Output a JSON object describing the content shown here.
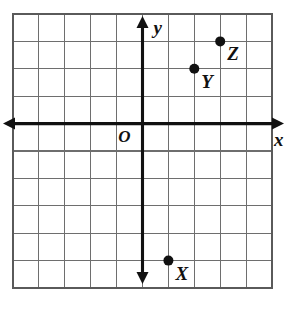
{
  "figure": {
    "name": "coordinate-plane-with-points",
    "background_color": "#ffffff"
  },
  "chart_data": {
    "type": "scatter",
    "title": "",
    "xlabel": "x",
    "ylabel": "y",
    "origin_label": "O",
    "grid": true,
    "grid_columns": 10,
    "grid_rows": 10,
    "xlim": [
      -5,
      5
    ],
    "ylim": [
      -6,
      4
    ],
    "x_ticks": [
      -5,
      -4,
      -3,
      -2,
      -1,
      0,
      1,
      2,
      3,
      4,
      5
    ],
    "y_ticks": [
      -6,
      -5,
      -4,
      -3,
      -2,
      -1,
      0,
      1,
      2,
      3,
      4
    ],
    "tick_labels_shown": false,
    "legend": "none",
    "points": [
      {
        "label": "X",
        "x": 1,
        "y": -5
      },
      {
        "label": "Y",
        "x": 2,
        "y": 2
      },
      {
        "label": "Z",
        "x": 3,
        "y": 3
      }
    ],
    "colors": {
      "point": "#111111",
      "axis": "#111111",
      "grid": "#6e6e6e",
      "border": "#5a5a5a"
    }
  },
  "geometry": {
    "grid_left": 13,
    "grid_top": 14,
    "cell_width": 25.9,
    "cell_height": 27.4,
    "origin_col": 5,
    "origin_row": 4
  },
  "labels": {
    "x_axis": "x",
    "y_axis": "y",
    "origin": "O",
    "point_x": "X",
    "point_y": "Y",
    "point_z": "Z"
  }
}
